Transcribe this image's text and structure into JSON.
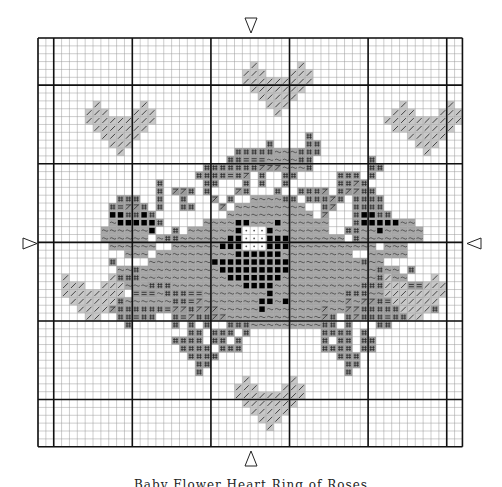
{
  "chart": {
    "title_caption": "Baby Flower Heart Ring of Roses",
    "grid": {
      "origin_x": 38,
      "origin_y": 38,
      "cell": 7.86,
      "cols": 54,
      "rows": 52,
      "thick_cols": [
        0,
        2,
        12,
        22,
        32,
        42,
        52,
        54
      ],
      "thick_rows": [
        0,
        6,
        16,
        26,
        36,
        46,
        52
      ],
      "line_color": "#9a9a9a",
      "thick_color": "#111111"
    },
    "center_markers": [
      {
        "name": "top-center-arrow",
        "direction": "down"
      },
      {
        "name": "bottom-center-arrow",
        "direction": "up"
      },
      {
        "name": "left-center-arrow",
        "direction": "right"
      },
      {
        "name": "right-center-arrow",
        "direction": "left"
      }
    ],
    "legend_symbols": {
      "h": {
        "fill": "#c8c8c8",
        "glyph": "/",
        "desc": "light heart stitch"
      },
      "~": {
        "fill": "#a6a6a6",
        "glyph": "~",
        "desc": "rose body stitch"
      },
      "#": {
        "fill": "#9c9c9c",
        "glyph": "#",
        "desc": "leaf stitch"
      },
      "=": {
        "fill": "#9c9c9c",
        "glyph": "=",
        "desc": "leaf shade stitch"
      },
      "Z": {
        "fill": "#9c9c9c",
        "glyph": "/",
        "desc": "stem stitch"
      },
      "B": {
        "fill": "#a6a6a6",
        "glyph": "■",
        "desc": "dark rose stitch"
      },
      "W": {
        "fill": "#ffffff",
        "glyph": "·",
        "desc": "highlight stitch"
      },
      "g": {
        "fill": "#a6a6a6",
        "glyph": "",
        "desc": "plain fill"
      }
    },
    "pattern_rows": [
      "......................................................",
      "......................................................",
      "......................................................",
      "...........................h.....h....................",
      "..........................hhh...hhh...................",
      "..........................hhhhhhhhh...................",
      "...........................hhhhhhh....................",
      "............................hhhhh.....................",
      ".......h.....h...............hhh..............h.....h.",
      "......hhh...hhh...............h..............hhh...hhh",
      "......hhhhhhhhh.............................hhhhhhhhhh",
      ".......hhhhhhh...............................hhhhhhhh.",
      "........hhhhh.....................#............hhhhh..",
      ".........hhh.................#....##............hhh...",
      "..........h..............#####~~~###.............h....",
      "........................##===~~~~##.......#...........",
      ".....................#######ZZZ~~~#.......##..........",
      "....................####=#Z.#..##.....###.#...........",
      "...............#.....##...#.#..#......##Z#............",
      "...............#.ZZ#.#...Z#...#..###Z.#ZZ##...........",
      "..........###..#..#...Z.#..~~~~##.###Z#.####..........",
      ".........#=ZZ#.#..##...Z.~~~~~~~~~..#Z..####..........",
      ".........BB##B#.........~~~~~~~~~~~.Z...#BB##.........",
      ".........~BBBBB#.....~~~~BB~~~B~~~~~~...#BBBBB~~......",
      "........~~~~~~B..#.~~~~~~BWWWB~~~~~~~..##~~B~~~~~.....",
      "........~~~~~~.~##~~~~~~BBWWWBBB~~~~~~~.#~~~~~~~~.....",
      ".........~~~~~~..~~~~~~BBBWWWBBB~~~~~~~~~~~.~~~.......",
      "...........~~~.~~~~~~~~~~BBBBBB~~~~~~~~~..~~~~~.......",
      ".........#....~~~~~~~~BBBBBBBBBB~~~~~~~~~#~~..........",
      "..........~~#~~~~~~~~~~BBBBBBBBB~~~~~~~~~~~#~~.#......",
      ".........~###~~~~~~~~~~~BBBBBBB~~~~~~~~~~~~##~~.......",
      "........===~~~###~~~~~~~~~BBBB~~~~~~~~~~~###~~~==.....",
      ".........~..===~###==~~~~~~~~B~~~~~~~~~###~~~~=##.....",
      ".........Z#~~~~~~##=Z~~~~~~~BB~B~~~~~~~Z~ZZ#=####.....",
      ".........Z######=ZZ#ZZZ~~~~~B~~~~~~~Z~~ZZ#####=#.##...",
      "..........##=##..#=Z##ZZ~~~~~~~~~~~~Z#.#Z###=##.#.....",
      "...........#.....#.#.#..###~~~~~~~~~##.#...##.........",
      "...................##.###.#.........####.#............",
      ".................####.##.#..........#.##.##...........",
      "..................####.###..........####.##...........",
      "...................####...............###.............",
      "....................##.................##.............",
      "....................#..................#..............",
      "..........................h.....h.....................",
      ".........................hhh...hhh....................",
      ".........................hhhhhhhhh....................",
      "..........................hhhhhhh.....................",
      "...........................hhhhh......................",
      "............................hhh.......................",
      ".............................h........................",
      "......................................................",
      "......................................................"
    ],
    "side_hearts": [
      {
        "name": "heart-left-lower",
        "rows": [
          "h.....h",
          "hhh..hhh",
          "hhhhhhhh",
          ".hhhhhh.",
          "..hhhh..",
          "...hh..."
        ],
        "col": 3,
        "row": 30
      },
      {
        "name": "heart-right-lower",
        "rows": [
          "h.....h",
          "hhh..hhh",
          "hhhhhhhh",
          ".hhhhhh.",
          "..hhhh..",
          "...hh..."
        ],
        "col": 44,
        "row": 30
      }
    ]
  }
}
